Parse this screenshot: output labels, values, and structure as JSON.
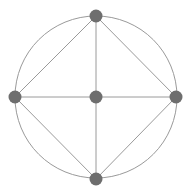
{
  "diagram": {
    "type": "graph",
    "colors": {
      "background": "#ffffff",
      "edge": "#9a9a9a",
      "node": "#6e6e6e",
      "circle": "#9a9a9a"
    },
    "circle": {
      "cx": 96,
      "cy": 97,
      "r": 81
    },
    "node_radius": 6.5,
    "nodes": [
      {
        "id": "top",
        "x": 96,
        "y": 16
      },
      {
        "id": "left",
        "x": 15,
        "y": 97
      },
      {
        "id": "center",
        "x": 96,
        "y": 97
      },
      {
        "id": "right",
        "x": 176,
        "y": 97
      },
      {
        "id": "bottom",
        "x": 96,
        "y": 179
      }
    ],
    "edges": [
      [
        "top",
        "left"
      ],
      [
        "top",
        "right"
      ],
      [
        "top",
        "center"
      ],
      [
        "left",
        "center"
      ],
      [
        "center",
        "right"
      ],
      [
        "center",
        "bottom"
      ],
      [
        "left",
        "bottom"
      ],
      [
        "right",
        "bottom"
      ]
    ]
  }
}
